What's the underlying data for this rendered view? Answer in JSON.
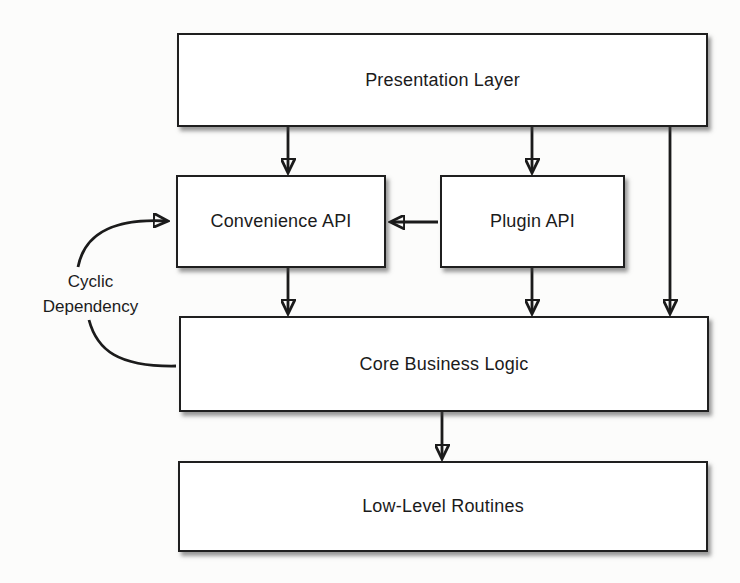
{
  "diagram": {
    "type": "block-diagram",
    "colors": {
      "background": "#fcfcfb",
      "box_fill": "#ffffff",
      "line": "#1b1b1b"
    },
    "nodes": [
      {
        "id": "presentation-layer",
        "label": "Presentation Layer"
      },
      {
        "id": "convenience-api",
        "label": "Convenience API"
      },
      {
        "id": "plugin-api",
        "label": "Plugin API"
      },
      {
        "id": "core-business-logic",
        "label": "Core Business Logic"
      },
      {
        "id": "low-level-routines",
        "label": "Low-Level Routines"
      }
    ],
    "annotation": {
      "line1": "Cyclic",
      "line2": "Dependency"
    },
    "edges": [
      {
        "from": "presentation-layer",
        "to": "convenience-api",
        "arrow": true,
        "style": "straight"
      },
      {
        "from": "presentation-layer",
        "to": "plugin-api",
        "arrow": true,
        "style": "straight"
      },
      {
        "from": "presentation-layer",
        "to": "core-business-logic",
        "arrow": true,
        "style": "straight"
      },
      {
        "from": "plugin-api",
        "to": "convenience-api",
        "arrow": true,
        "style": "straight"
      },
      {
        "from": "convenience-api",
        "to": "core-business-logic",
        "arrow": true,
        "style": "straight"
      },
      {
        "from": "plugin-api",
        "to": "core-business-logic",
        "arrow": true,
        "style": "straight"
      },
      {
        "from": "core-business-logic",
        "to": "low-level-routines",
        "arrow": true,
        "style": "straight"
      },
      {
        "from": "core-business-logic",
        "to": "convenience-api",
        "arrow": true,
        "style": "curved",
        "label": "Cyclic Dependency"
      }
    ]
  }
}
